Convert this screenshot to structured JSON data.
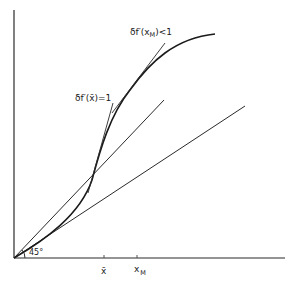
{
  "diagram": {
    "type": "economic-function-diagram",
    "axes": {
      "x_ticks": [
        {
          "label": "x̄",
          "x": 104
        },
        {
          "label": "x",
          "subscript": "M",
          "x": 137
        }
      ],
      "angle_label": "45°"
    },
    "labels": {
      "tangent_xbar": {
        "prefix": "δf′(",
        "var": "x̄",
        "suffix": ")=1"
      },
      "tangent_xm": {
        "prefix": "δf′(x",
        "subscript": "M",
        "suffix": ")<1"
      }
    },
    "elements": [
      "y-axis",
      "x-axis",
      "45-degree line",
      "lower ray from origin",
      "S-shaped function curve",
      "tangent at x̄ (slope 1)",
      "tangent at x_M (slope < 1)"
    ],
    "colors": {
      "ink": "#1a1a1a",
      "background": "#ffffff"
    }
  }
}
